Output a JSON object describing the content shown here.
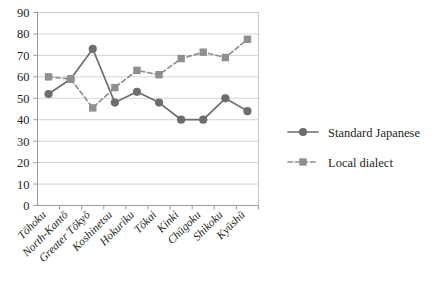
{
  "chart_data": {
    "type": "line",
    "title": "",
    "xlabel": "",
    "ylabel": "",
    "ylim": [
      0,
      90
    ],
    "ytick_step": 10,
    "yticks": [
      "0",
      "10",
      "20",
      "30",
      "40",
      "50",
      "60",
      "70",
      "80",
      "90"
    ],
    "grid": true,
    "legend_position": "right",
    "categories": [
      "Tōhoku",
      "North-Kantō",
      "Greater Tōkyō",
      "Koshinetsu",
      "Hokuriku",
      "Tōkai",
      "Kinki",
      "Chūgoku",
      "Shikoku",
      "Kyūshū"
    ],
    "series": [
      {
        "name": "Standard Japanese",
        "values": [
          52,
          59,
          73,
          48,
          53,
          48,
          40,
          40,
          50,
          44
        ],
        "color": "#6d6d6d",
        "marker": "circle",
        "line_style": "solid"
      },
      {
        "name": "Local dialect",
        "values": [
          60,
          59,
          45.5,
          55,
          63,
          61,
          68.5,
          71.5,
          69,
          77.5
        ],
        "color": "#8f8f8f",
        "marker": "square",
        "line_style": "dashed"
      }
    ]
  },
  "legend": {
    "items": [
      {
        "label": "Standard Japanese",
        "marker": "circle-marker",
        "style": "solid"
      },
      {
        "label": "Local dialect",
        "marker": "square-marker",
        "style": "dashed"
      }
    ]
  },
  "colors": {
    "series_standard": "#6d6d6d",
    "series_dialect": "#8f8f8f",
    "gridline": "#d4d4d4",
    "axis": "#9a9a9a",
    "text": "#231f20",
    "background": "#ffffff"
  }
}
